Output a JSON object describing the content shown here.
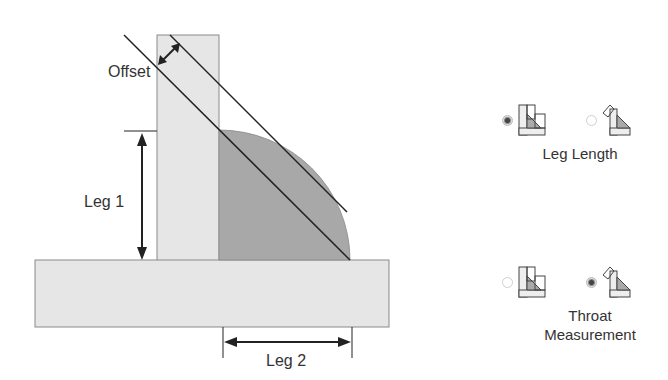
{
  "diagram": {
    "labels": {
      "offset": "Offset",
      "leg1": "Leg 1",
      "leg2": "Leg 2"
    },
    "colors": {
      "plate": "#e6e6e6",
      "plate_stroke": "#888888",
      "weld": "#a6a6a6",
      "line": "#222222"
    }
  },
  "options": {
    "leg_length": {
      "caption": "Leg Length",
      "choices": [
        {
          "icon": "leg-length-weld-icon",
          "selected": true
        },
        {
          "icon": "throat-weld-icon",
          "selected": false
        }
      ]
    },
    "throat_measurement": {
      "caption_line1": "Throat",
      "caption_line2": "Measurement",
      "choices": [
        {
          "icon": "leg-length-weld-icon",
          "selected": false
        },
        {
          "icon": "throat-weld-icon",
          "selected": true
        }
      ]
    }
  }
}
